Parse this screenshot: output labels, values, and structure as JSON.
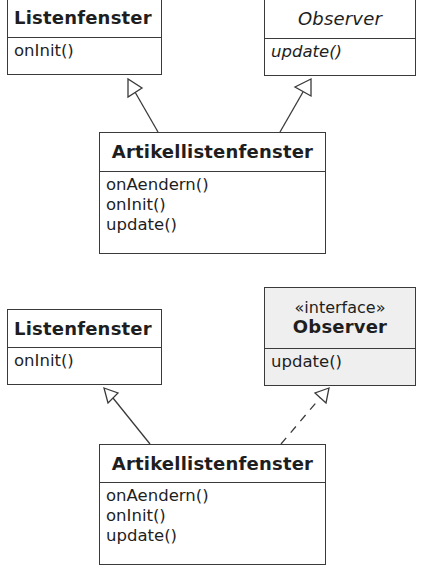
{
  "diagrams": [
    {
      "label": "top",
      "classes": {
        "listenfenster": {
          "name": "Listenfenster",
          "operations": [
            "onInit()"
          ]
        },
        "observer": {
          "name": "Observer",
          "name_style": "italic",
          "operations": [
            "update()"
          ],
          "operations_style": "italic"
        },
        "artikel": {
          "name": "Artikellistenfenster",
          "operations": [
            "onAendern()",
            "onInit()",
            "update()"
          ]
        }
      },
      "relations": [
        {
          "from": "Artikellistenfenster",
          "to": "Listenfenster",
          "type": "generalization",
          "line": "solid"
        },
        {
          "from": "Artikellistenfenster",
          "to": "Observer",
          "type": "generalization",
          "line": "solid"
        }
      ]
    },
    {
      "label": "bottom",
      "classes": {
        "listenfenster": {
          "name": "Listenfenster",
          "operations": [
            "onInit()"
          ]
        },
        "observer": {
          "stereotype": "«interface»",
          "name": "Observer",
          "operations": [
            "update()"
          ],
          "fill": "#efefef"
        },
        "artikel": {
          "name": "Artikellistenfenster",
          "operations": [
            "onAendern()",
            "onInit()",
            "update()"
          ]
        }
      },
      "relations": [
        {
          "from": "Artikellistenfenster",
          "to": "Listenfenster",
          "type": "generalization",
          "line": "solid"
        },
        {
          "from": "Artikellistenfenster",
          "to": "Observer",
          "type": "realization",
          "line": "dashed"
        }
      ]
    }
  ],
  "colors": {
    "line": "#3a3a3a",
    "text": "#1e1e1e",
    "interface_fill": "#efefef",
    "background": "#ffffff"
  }
}
